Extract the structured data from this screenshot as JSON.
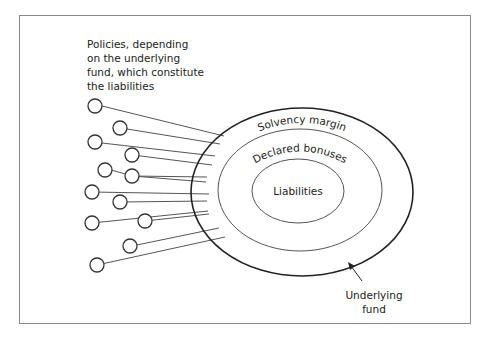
{
  "diagram": {
    "type": "nested-ellipse-diagram",
    "description_label": "Policies, depending on the underlying fund, which constitute the liabilities",
    "description_lines": [
      "Policies, depending",
      "on the underlying",
      "fund, which constitute",
      "the liabilities"
    ],
    "rings": [
      {
        "name": "Solvency margin",
        "level": "outer"
      },
      {
        "name": "Declared bonuses",
        "level": "middle"
      },
      {
        "name": "Liabilities",
        "level": "inner"
      }
    ],
    "outer_label": "Underlying fund",
    "outer_label_lines": [
      "Underlying",
      "fund"
    ],
    "policy_count": 14,
    "colors": {
      "stroke": "#333333",
      "frame": "#8a8a8a",
      "text": "#222222"
    }
  }
}
